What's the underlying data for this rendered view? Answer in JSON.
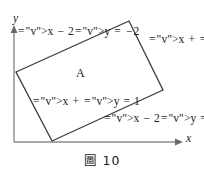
{
  "figure": {
    "caption": "圖 10",
    "region_label": "A",
    "axes": {
      "x_label": "x",
      "y_label": "y",
      "origin": [
        14,
        142
      ],
      "x_axis_end": [
        178,
        142
      ],
      "y_axis_end": [
        14,
        28
      ]
    },
    "shape": {
      "type": "rectangle",
      "vertices": [
        [
          16,
          72
        ],
        [
          129,
          21
        ],
        [
          163,
          90
        ],
        [
          52,
          141
        ]
      ]
    },
    "boundary_lines": [
      {
        "id": "top-left-edge",
        "equation_text": "x − 2y = −2",
        "lhs_x": "x",
        "lhs_op": "−",
        "lhs_coef": "2",
        "lhs_y": "y",
        "eq": "=",
        "rhs": "−2"
      },
      {
        "id": "right-edge",
        "equation_text": "x + y = 4",
        "lhs_x": "x",
        "lhs_op": "+",
        "lhs_coef": "",
        "lhs_y": "y",
        "eq": "=",
        "rhs": "4"
      },
      {
        "id": "left-edge",
        "equation_text": "x + y = 1",
        "lhs_x": "x",
        "lhs_op": "+",
        "lhs_coef": "",
        "lhs_y": "y",
        "eq": "=",
        "rhs": "1"
      },
      {
        "id": "bottom-edge",
        "equation_text": "x − 2y = 1",
        "lhs_x": "x",
        "lhs_op": "−",
        "lhs_coef": "2",
        "lhs_y": "y",
        "eq": "=",
        "rhs": "1"
      }
    ],
    "colors": {
      "shape_stroke": "#3a3a3a",
      "axis_stroke": "#8a8a8a",
      "text": "#1a1a1a",
      "background": "#ffffff"
    }
  }
}
